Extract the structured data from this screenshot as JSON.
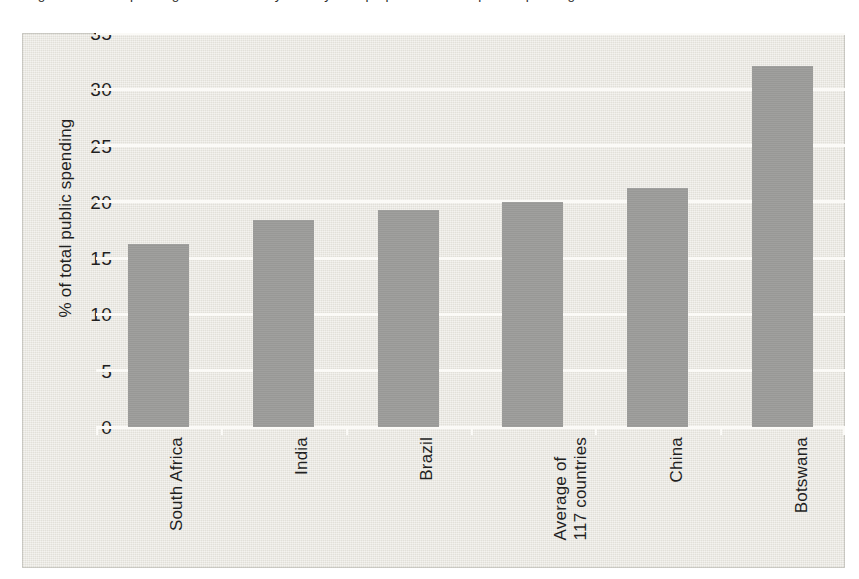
{
  "caption": {
    "bullet_icon": "filled-circle-bullet",
    "text": "Figure 1  Public spending on education by country as a proportion of total public spending"
  },
  "chart_data": {
    "type": "bar",
    "title": "",
    "xlabel": "",
    "ylabel": "% of total public spending",
    "categories": [
      "South Africa",
      "India",
      "Brazil",
      "Average of\n117 countries",
      "China",
      "Botswana"
    ],
    "values": [
      16.3,
      18.4,
      19.3,
      20.0,
      21.2,
      32.1
    ],
    "ylim": [
      0,
      35
    ],
    "yticks": [
      0,
      5,
      10,
      15,
      20,
      25,
      30,
      35
    ],
    "ytick_labels": [
      "0",
      "5",
      "10",
      "15",
      "20",
      "25",
      "30",
      "35"
    ],
    "grid": true,
    "grid_color": "#fbfaf7",
    "legend": "none",
    "bar_color": "#9b9b99",
    "plot_background": "#e6e4dd"
  }
}
